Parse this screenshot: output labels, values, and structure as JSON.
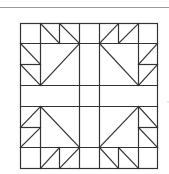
{
  "diagram": {
    "type": "quilt-block",
    "width": 169,
    "height": 174,
    "colors": {
      "background": "#ffffff",
      "line": "#333333",
      "rule": "#9a9a9a",
      "artifact": "#d0d0d0"
    },
    "rule": {
      "x1": 0,
      "y1": 7,
      "x2": 169,
      "y2": 7,
      "width": 1
    },
    "block": {
      "x": 20,
      "y": 23,
      "w": 137,
      "h": 145,
      "stroke_width": 1.2
    },
    "segments": [
      [
        40,
        23,
        40,
        85
      ],
      [
        59,
        23,
        59,
        43
      ],
      [
        79,
        23,
        79,
        168
      ],
      [
        99,
        23,
        99,
        168
      ],
      [
        118,
        23,
        118,
        43
      ],
      [
        138,
        23,
        138,
        85
      ],
      [
        40,
        106,
        40,
        168
      ],
      [
        59,
        147,
        59,
        168
      ],
      [
        118,
        147,
        118,
        168
      ],
      [
        138,
        106,
        138,
        168
      ],
      [
        20,
        43,
        157,
        43
      ],
      [
        20,
        64,
        40,
        64
      ],
      [
        138,
        64,
        157,
        64
      ],
      [
        20,
        85,
        157,
        85
      ],
      [
        20,
        106,
        157,
        106
      ],
      [
        20,
        127,
        40,
        127
      ],
      [
        138,
        127,
        157,
        127
      ],
      [
        20,
        147,
        157,
        147
      ],
      [
        40,
        23,
        59,
        43
      ],
      [
        59,
        23,
        79,
        43
      ],
      [
        20,
        43,
        40,
        64
      ],
      [
        20,
        64,
        40,
        85
      ],
      [
        40,
        85,
        79,
        43
      ],
      [
        99,
        43,
        118,
        23
      ],
      [
        118,
        43,
        138,
        23
      ],
      [
        138,
        64,
        157,
        43
      ],
      [
        138,
        85,
        157,
        64
      ],
      [
        99,
        43,
        138,
        85
      ],
      [
        20,
        127,
        40,
        106
      ],
      [
        20,
        147,
        40,
        127
      ],
      [
        40,
        168,
        59,
        147
      ],
      [
        59,
        168,
        79,
        147
      ],
      [
        40,
        106,
        79,
        147
      ],
      [
        138,
        106,
        157,
        127
      ],
      [
        138,
        127,
        157,
        147
      ],
      [
        99,
        147,
        118,
        168
      ],
      [
        118,
        147,
        138,
        168
      ],
      [
        99,
        147,
        138,
        106
      ]
    ],
    "artifact_dot": {
      "x": 168,
      "y": 102,
      "r": 0.8
    }
  }
}
